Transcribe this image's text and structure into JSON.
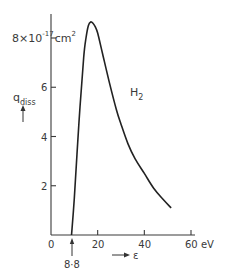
{
  "chart_data": {
    "type": "line",
    "title": "",
    "xlabel": "ε",
    "x_unit": "eV",
    "ylabel": "q_diss",
    "y_unit": "×10^-17 cm^2",
    "xlim": [
      0,
      60
    ],
    "ylim": [
      0,
      8
    ],
    "x_ticks": [
      0,
      20,
      40,
      60
    ],
    "x_tick_labels": [
      "0",
      "20",
      "40",
      "60 eV"
    ],
    "y_ticks": [
      2,
      4,
      6,
      8
    ],
    "y_tick_labels": [
      "2",
      "4",
      "6",
      "8×10"
    ],
    "y_top_label_exponent": "-17",
    "y_top_label_unit": "cm",
    "y_top_label_unit_power": "2",
    "grid": false,
    "annotations": [
      {
        "text": "8·8",
        "x": 8.8,
        "note": "threshold energy, marked by arrow below axis"
      },
      {
        "text": "H",
        "subscript": "2",
        "note": "curve label"
      }
    ],
    "series": [
      {
        "name": "H2",
        "x": [
          8.8,
          10,
          12,
          14,
          15,
          16,
          17,
          18,
          19,
          20,
          22,
          25,
          28,
          30,
          33,
          36,
          40,
          44,
          48,
          51.5
        ],
        "y": [
          0,
          1.5,
          4.6,
          7.2,
          8.0,
          8.5,
          8.65,
          8.6,
          8.45,
          8.2,
          7.4,
          6.2,
          5.1,
          4.5,
          3.7,
          3.1,
          2.5,
          1.9,
          1.45,
          1.1
        ]
      }
    ]
  },
  "labels": {
    "y_top_value": "8",
    "y_top_times": "×10",
    "y_top_exp": "-17",
    "y_top_unit": "cm",
    "y_top_unit_exp": "2",
    "y_label_main": "q",
    "y_label_sub": "diss",
    "x_label": "ε",
    "threshold": "8·8",
    "species": "H",
    "species_sub": "2",
    "x_unit": "eV"
  }
}
